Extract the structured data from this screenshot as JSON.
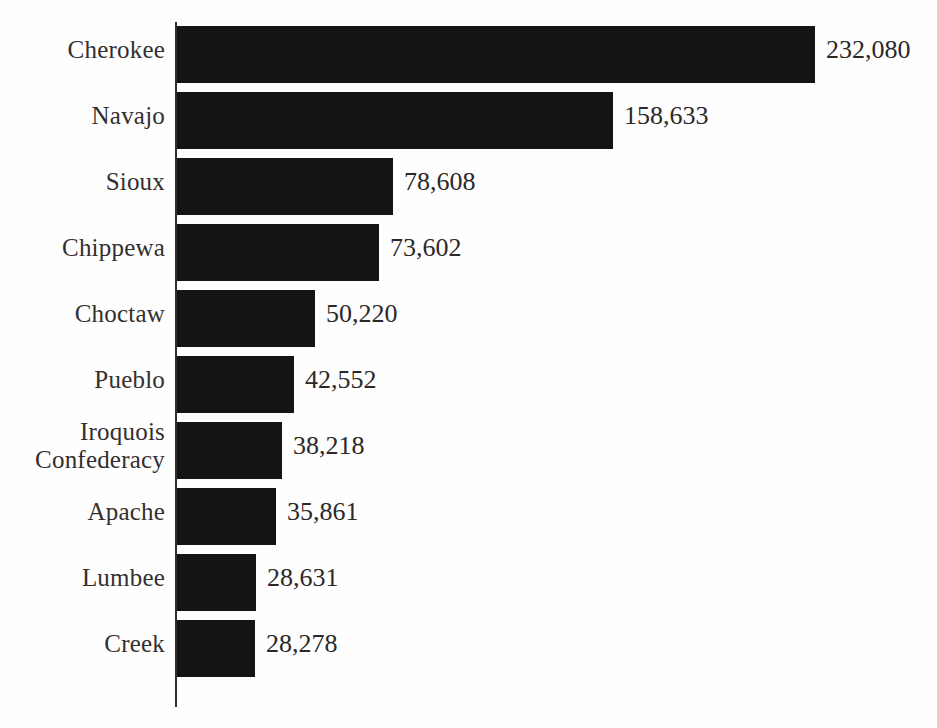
{
  "chart_data": {
    "type": "bar",
    "orientation": "horizontal",
    "title": "",
    "subtitle": "",
    "xlabel": "",
    "ylabel": "",
    "grid": false,
    "legend": null,
    "axis_line": "vertical category axis at left of bars",
    "value_label_format": "comma-separated thousands",
    "xlim": [
      0,
      232080
    ],
    "categories": [
      "Cherokee",
      "Navajo",
      "Sioux",
      "Chippewa",
      "Choctaw",
      "Pueblo",
      "Iroquois\nConfederacy",
      "Apache",
      "Lumbee",
      "Creek"
    ],
    "values": [
      232080,
      158633,
      78608,
      73602,
      50220,
      42552,
      38218,
      35861,
      28631,
      28278
    ],
    "value_labels": [
      "232,080",
      "158,633",
      "78,608",
      "73,602",
      "50,220",
      "42,552",
      "38,218",
      "35,861",
      "28,631",
      "28,278"
    ]
  },
  "style": {
    "bar_color": "#141414",
    "text_color": "#332f2e",
    "background_color": "#fefefe",
    "axis_color": "#2e2e2e"
  }
}
